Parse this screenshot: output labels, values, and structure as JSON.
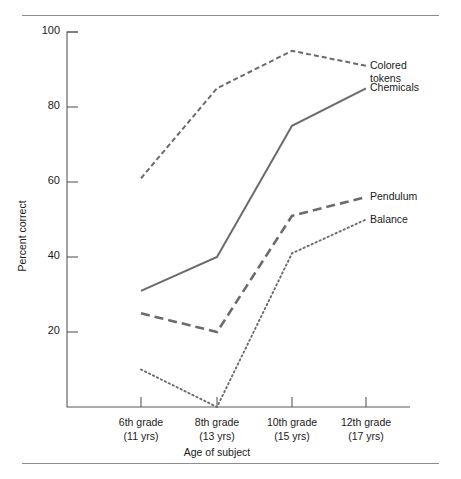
{
  "figure": {
    "top_rule": "horizontal-rule",
    "bottom_rule": "horizontal-rule"
  },
  "chart_data": {
    "type": "line",
    "title": "",
    "xlabel": "Age of subject",
    "ylabel": "Percent correct",
    "categories": [
      "6th grade\n(11 yrs)",
      "8th grade\n(13 yrs)",
      "10th grade\n(15 yrs)",
      "12th grade\n(17 yrs)"
    ],
    "category_labels": [
      {
        "grade": "6th grade",
        "age": "(11 yrs)"
      },
      {
        "grade": "8th grade",
        "age": "(13 yrs)"
      },
      {
        "grade": "10th grade",
        "age": "(15 yrs)"
      },
      {
        "grade": "12th grade",
        "age": "(17 yrs)"
      }
    ],
    "ylim": [
      0,
      100
    ],
    "yticks": [
      20,
      40,
      60,
      80,
      100
    ],
    "ytick_labels": [
      "20",
      "40",
      "60",
      "80",
      "100"
    ],
    "grid": false,
    "legend_position": "right-inline-annotations",
    "series": [
      {
        "name": "Colored tokens",
        "label_lines": [
          "Colored",
          "tokens"
        ],
        "style": "dashed-short",
        "color": "#6b6b6b",
        "values": [
          61,
          85,
          95,
          91
        ]
      },
      {
        "name": "Chemicals",
        "label_lines": [
          "Chemicals"
        ],
        "style": "solid",
        "color": "#6b6b6b",
        "values": [
          31,
          40,
          75,
          85
        ]
      },
      {
        "name": "Pendulum",
        "label_lines": [
          "Pendulum"
        ],
        "style": "dashed-long",
        "color": "#6b6b6b",
        "values": [
          25,
          20,
          51,
          56
        ]
      },
      {
        "name": "Balance",
        "label_lines": [
          "Balance"
        ],
        "style": "dotted",
        "color": "#6b6b6b",
        "values": [
          10,
          0,
          41,
          50
        ]
      }
    ]
  }
}
